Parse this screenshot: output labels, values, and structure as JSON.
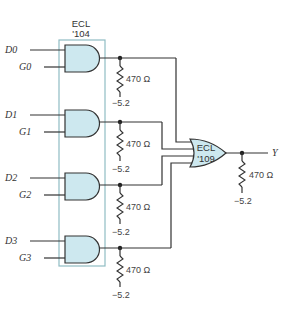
{
  "diagram": {
    "ic_and": {
      "name_line1": "ECL",
      "name_line2": "'104"
    },
    "ic_or": {
      "name_line1": "ECL",
      "name_line2": "'109"
    },
    "inputs": [
      {
        "d": "D0",
        "g": "G0"
      },
      {
        "d": "D1",
        "g": "G1"
      },
      {
        "d": "D2",
        "g": "G2"
      },
      {
        "d": "D3",
        "g": "G3"
      }
    ],
    "pulldown_resistors": [
      {
        "value": "470 Ω",
        "supply": "−5.2"
      },
      {
        "value": "470 Ω",
        "supply": "−5.2"
      },
      {
        "value": "470 Ω",
        "supply": "−5.2"
      },
      {
        "value": "470 Ω",
        "supply": "−5.2"
      }
    ],
    "output": {
      "label": "Y",
      "resistor": "470 Ω",
      "supply": "−5.2"
    },
    "colors": {
      "gate_fill": "#cde8ef",
      "ic_outline": "#8fbcc3",
      "wire": "#333333"
    }
  }
}
